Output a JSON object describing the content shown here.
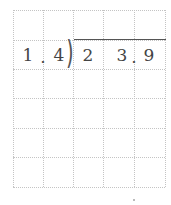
{
  "problem": {
    "divisor": {
      "digits": [
        "1",
        ".",
        "4"
      ]
    },
    "dividend": {
      "digits": [
        "2",
        "3",
        ".",
        "9"
      ]
    },
    "operation": "long division"
  },
  "grid": {
    "columns": 5,
    "rows": 6,
    "line_color": "#c4c4c4"
  },
  "colors": {
    "digit": "#444444",
    "division_bar": "#555555"
  }
}
